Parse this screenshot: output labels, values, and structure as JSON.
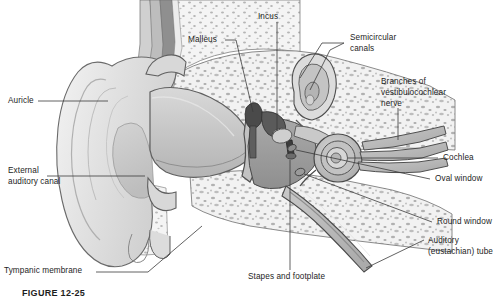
{
  "figure": {
    "caption": "FIGURE 12-25",
    "background_color": "#ffffff",
    "line_color": "#3a3a3a",
    "text_color": "#1d1d1d"
  },
  "labels": {
    "auricle": "Auricle",
    "external_auditory_canal_l1": "External",
    "external_auditory_canal_l2": "auditory canal",
    "tympanic_membrane": "Tympanic membrane",
    "malleus": "Malleus",
    "incus": "Incus",
    "semicircular_canals_l1": "Semicircular",
    "semicircular_canals_l2": "canals",
    "branches_nerve_l1": "Branches of",
    "branches_nerve_l2": "vestibulocochlear",
    "branches_nerve_l3": "nerve",
    "cochlea": "Cochlea",
    "oval_window": "Oval window",
    "round_window": "Round window",
    "auditory_tube_l1": "Auditory",
    "auditory_tube_l2": "(eustachian) tube",
    "stapes_footplate": "Stapes and footplate"
  },
  "structures": [
    "auricle",
    "external auditory canal",
    "tympanic membrane",
    "malleus",
    "incus",
    "stapes and footplate",
    "semicircular canals",
    "cochlea",
    "oval window",
    "round window",
    "auditory (eustachian) tube",
    "branches of vestibulocochlear nerve",
    "temporal bone"
  ]
}
